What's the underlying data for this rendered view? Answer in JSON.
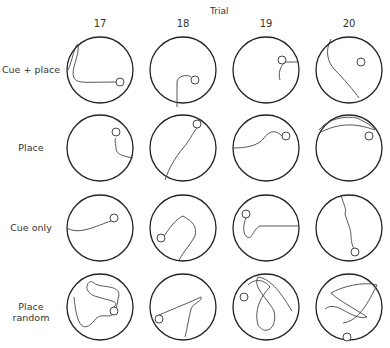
{
  "figure": {
    "axis_title": "Trial",
    "columns": [
      "17",
      "18",
      "19",
      "20"
    ],
    "rows": [
      "Cue + place",
      "Place",
      "Cue only",
      "Place random"
    ]
  },
  "paths": [
    [
      "M-32,0 C-28,-8 -24,-30 -22,-25 C-20,-15 -30,0 -26,8 C-22,14 -15,12 20,12",
      "M-6,37 L-6,12 C-6,6 4,4 8,7",
      "M33,-8 L20,-8 C14,-5 12,4 14,10",
      "M-18,-31 C-24,-20 -22,-8 -14,0 C-6,8 6,22 10,28"
    ],
    [
      "M33,10 C22,8 16,6 16,0 C16,-4 14,-8 16,-10",
      "M-18,32 C-14,20 -8,10 0,0 C6,-6 10,-16 14,-20",
      "M-33,0 C-20,0 -8,-2 -2,-10 C4,-18 10,-18 16,-12",
      "M-30,-18 C-20,-30 -4,-32 8,-30 C16,-26 24,-22 26,-18 C14,-22 -4,-28 -28,-16"
    ],
    [
      "M-33,0 C-20,8 0,-4 14,-8",
      "M-20,10 C-14,0 -6,-10 0,-12 C10,-6 14,-2 12,8 C8,16 0,24 -4,32",
      "M33,-2 L-6,-2 C-14,2 -14,14 -20,8 C-24,4 -22,-6 -20,-10",
      "M-8,-33 C-6,-24 -2,-20 -4,-14 C-2,-6 2,0 2,8 C2,14 4,20 6,22"
    ],
    [
      "M-26,-10 C-24,10 -20,30 -6,14 C4,0 14,22 18,-8 C24,-24 0,-18 -6,-24 C-12,-30 -20,-14 -2,-10 C10,-6 20,-6 14,0",
      "M-24,8 C-10,2 10,-6 18,-10 C20,-6 10,-4 8,2 C6,10 4,22 2,30",
      "M-18,-22 C-10,-30 0,-26 4,-20 C-6,-10 -12,4 -8,18 C0,30 12,20 8,4 C2,-8 -14,-20 -8,-30 C6,-28 16,-12 26,4",
      "M-24,2 C-12,-8 2,14 18,10 C10,4 -10,-6 -18,-14 C-8,-20 14,-26 28,-22 C20,-6 10,14 -6,16"
    ]
  ],
  "platforms": [
    [
      [
        20,
        12
      ],
      [
        12,
        10
      ],
      [
        16,
        -10
      ],
      [
        12,
        -8
      ]
    ],
    [
      [
        16,
        -16
      ],
      [
        14,
        -24
      ],
      [
        20,
        -12
      ],
      [
        20,
        -12
      ]
    ],
    [
      [
        14,
        -10
      ],
      [
        -22,
        10
      ],
      [
        -20,
        -14
      ],
      [
        6,
        24
      ]
    ],
    [
      [
        14,
        4
      ],
      [
        -24,
        12
      ],
      [
        -22,
        -10
      ],
      [
        -2,
        30
      ]
    ]
  ]
}
